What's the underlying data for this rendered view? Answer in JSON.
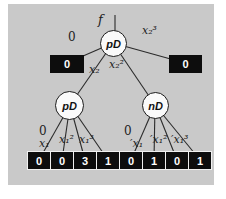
{
  "figure": {
    "function_label": "f",
    "nodes": {
      "root": "pD",
      "left": "pD",
      "right": "nD"
    },
    "root_edge_labels": [
      "0",
      "x₂",
      "x₂²",
      "x₂³"
    ],
    "top_terminals": [
      "0",
      "0"
    ],
    "left_edge_labels": [
      "0",
      "x₁",
      "x₁²",
      "x₁³"
    ],
    "right_edge_labels": [
      "0",
      "′x₁",
      "′x₁²",
      "′x₁³"
    ],
    "bottom_terminals": [
      "0",
      "0",
      "3",
      "1",
      "0",
      "1",
      "0",
      "1"
    ],
    "colors": {
      "panel_background": "#c9c9c9",
      "terminal_background": "#0d0d0d",
      "terminal_text": "#ffffff",
      "edge_stroke": "#2b2b2b",
      "node_fill": "#fafafa"
    }
  }
}
